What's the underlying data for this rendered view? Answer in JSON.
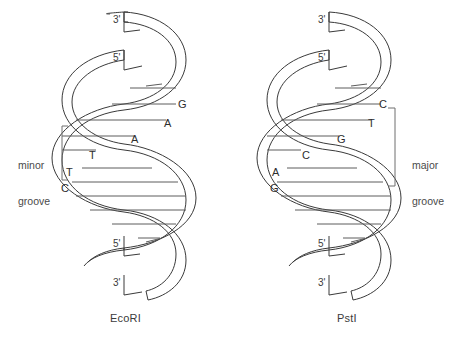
{
  "figure": {
    "background_color": "#ffffff",
    "stroke_color": "#3a3a3a",
    "rung_color": "#5c5c5c",
    "text_color": "#3b3b3b",
    "width": 459,
    "height": 351
  },
  "panels": [
    {
      "id": "ecori",
      "caption": "EcoRI",
      "groove": {
        "label_line1": "minor",
        "label_line2": "groove",
        "side": "left"
      },
      "ends": [
        {
          "name": "top-3-prime",
          "text": "3'",
          "x": 113,
          "y": 14
        },
        {
          "name": "top-5-prime",
          "text": "5'",
          "x": 113,
          "y": 52
        },
        {
          "name": "bottom-5-prime",
          "text": "5'",
          "x": 113,
          "y": 238
        },
        {
          "name": "bottom-3-prime",
          "text": "3'",
          "x": 113,
          "y": 277
        }
      ],
      "bases": [
        {
          "letter": "G",
          "x": 178,
          "y": 99
        },
        {
          "letter": "A",
          "x": 164,
          "y": 118
        },
        {
          "letter": "A",
          "x": 131,
          "y": 134
        },
        {
          "letter": "T",
          "x": 89,
          "y": 150
        },
        {
          "letter": "T",
          "x": 66,
          "y": 167
        },
        {
          "letter": "C",
          "x": 61,
          "y": 183
        }
      ],
      "recognition_sequence": "GAATTC"
    },
    {
      "id": "psti",
      "caption": "PstI",
      "groove": {
        "label_line1": "major",
        "label_line2": "groove",
        "side": "right"
      },
      "ends": [
        {
          "name": "top-3-prime",
          "text": "3'",
          "x": 318,
          "y": 14
        },
        {
          "name": "top-5-prime",
          "text": "5'",
          "x": 318,
          "y": 52
        },
        {
          "name": "bottom-5-prime",
          "text": "5'",
          "x": 318,
          "y": 238
        },
        {
          "name": "bottom-3-prime",
          "text": "3'",
          "x": 318,
          "y": 277
        }
      ],
      "bases": [
        {
          "letter": "C",
          "x": 379,
          "y": 99
        },
        {
          "letter": "T",
          "x": 368,
          "y": 118
        },
        {
          "letter": "G",
          "x": 337,
          "y": 134
        },
        {
          "letter": "C",
          "x": 302,
          "y": 150
        },
        {
          "letter": "A",
          "x": 272,
          "y": 167
        },
        {
          "letter": "G",
          "x": 270,
          "y": 183
        }
      ],
      "recognition_sequence": "CTGCAG"
    }
  ],
  "captions": {
    "left": "EcoRI",
    "right": "PstI",
    "left_x": 110,
    "right_x": 337,
    "y": 313
  },
  "groove_labels": {
    "minor_line1": "minor",
    "minor_line2": "groove",
    "minor_x": 18,
    "minor_y": 135,
    "major_line1": "major",
    "major_line2": "groove",
    "major_x": 412,
    "major_y": 135
  }
}
